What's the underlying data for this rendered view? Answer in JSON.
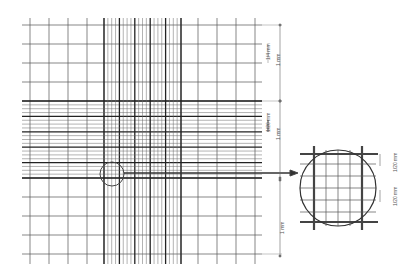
{
  "diagram": {
    "colors": {
      "line": "#333333",
      "thin_line": "#555555",
      "background": "#ffffff"
    },
    "grid": {
      "left": 22,
      "right": 262,
      "top": 18,
      "bottom": 258,
      "large_square_px": 19,
      "center_block": {
        "x0": 104,
        "x1": 181,
        "y0": 101,
        "y1": 178
      }
    },
    "dimensions": [
      {
        "id": "dim-top-1mm",
        "label": "1 mm"
      },
      {
        "id": "dim-top-sub",
        "label": "1/4 mm"
      },
      {
        "id": "dim-mid-1mm",
        "label": "1 mm"
      },
      {
        "id": "dim-mid-sub",
        "label": "1/20 mm"
      },
      {
        "id": "dim-bot-1mm",
        "label": "1 mm"
      }
    ],
    "magnified_view": {
      "cx": 338,
      "cy": 188,
      "r": 38,
      "labels": [
        {
          "id": "mag-top",
          "label": "1/20 mm"
        },
        {
          "id": "mag-bottom",
          "label": "1/20 mm"
        }
      ]
    },
    "highlight_circle": {
      "cx": 112,
      "cy": 174,
      "r": 12
    }
  }
}
